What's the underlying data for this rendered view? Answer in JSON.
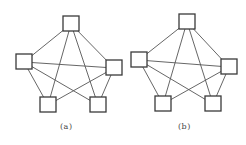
{
  "figure": {
    "colors": {
      "edge": "#555555",
      "node_border": "#3a3a3a",
      "background": "#ffffff"
    },
    "node_size": 16,
    "graphs": [
      {
        "id": "a",
        "caption": "(a)",
        "caption_pos": {
          "x": 60,
          "y": 122
        },
        "nodes": [
          {
            "id": "top",
            "cx": 71,
            "cy": 24
          },
          {
            "id": "left",
            "cx": 24,
            "cy": 62
          },
          {
            "id": "right",
            "cx": 114,
            "cy": 68
          },
          {
            "id": "bottom-left",
            "cx": 48,
            "cy": 105
          },
          {
            "id": "bottom-right",
            "cx": 98,
            "cy": 105
          }
        ],
        "edges": [
          [
            "top",
            "left"
          ],
          [
            "top",
            "right"
          ],
          [
            "top",
            "bottom-left"
          ],
          [
            "top",
            "bottom-right"
          ],
          [
            "left",
            "right"
          ],
          [
            "left",
            "bottom-left"
          ],
          [
            "left",
            "bottom-right"
          ],
          [
            "right",
            "bottom-left"
          ],
          [
            "right",
            "bottom-right"
          ]
        ]
      },
      {
        "id": "b",
        "caption": "(b)",
        "caption_pos": {
          "x": 178,
          "y": 122
        },
        "nodes": [
          {
            "id": "top",
            "cx": 187,
            "cy": 22
          },
          {
            "id": "left",
            "cx": 139,
            "cy": 60
          },
          {
            "id": "right",
            "cx": 229,
            "cy": 67
          },
          {
            "id": "bottom-left",
            "cx": 163,
            "cy": 104
          },
          {
            "id": "bottom-right",
            "cx": 213,
            "cy": 104
          }
        ],
        "edges": [
          [
            "top",
            "left"
          ],
          [
            "top",
            "right"
          ],
          [
            "top",
            "bottom-left"
          ],
          [
            "top",
            "bottom-right"
          ],
          [
            "left",
            "right"
          ],
          [
            "left",
            "bottom-left"
          ],
          [
            "left",
            "bottom-right"
          ],
          [
            "right",
            "bottom-left"
          ],
          [
            "right",
            "bottom-right"
          ]
        ]
      }
    ]
  }
}
